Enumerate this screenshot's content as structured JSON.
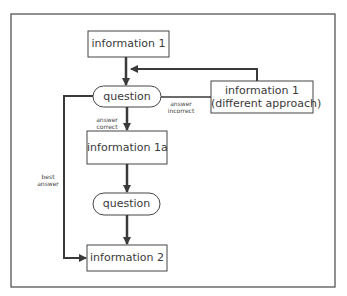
{
  "diagram": {
    "type": "flowchart",
    "nodes": {
      "info1": "information 1",
      "question1": "question",
      "info1_diff_line1": "information 1",
      "info1_diff_line2": "(different approach)",
      "info1a": "information 1a",
      "question2": "question",
      "info2": "information 2"
    },
    "edge_labels": {
      "answer_incorrect_1": "answer",
      "answer_incorrect_2": "incorrect",
      "answer_correct_1": "answer",
      "answer_correct_2": "correct",
      "best_answer_1": "best",
      "best_answer_2": "answer"
    },
    "colors": {
      "line": "#3a3a3a",
      "frame": "#555555",
      "background": "#ffffff"
    }
  }
}
